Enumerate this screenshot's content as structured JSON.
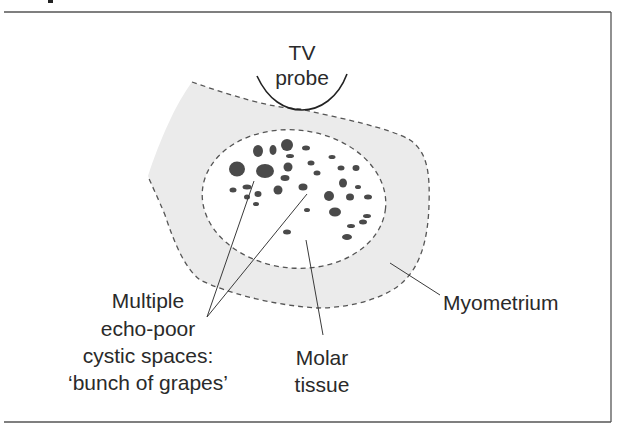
{
  "figure": {
    "title_fragment": "",
    "labels": {
      "probe_line1": "TV",
      "probe_line2": "probe",
      "cysts_line1": "Multiple",
      "cysts_line2": "echo-poor",
      "cysts_line3": "cystic spaces:",
      "cysts_line4": "‘bunch of grapes’",
      "molar_line1": "Molar",
      "molar_line2": "tissue",
      "myometrium": "Myometrium"
    },
    "colors": {
      "myometrium_fill": "#ebebeb",
      "cyst_fill": "#4a4a4a",
      "outline": "#555555",
      "text": "#2a2a2a"
    },
    "cysts": [
      {
        "cx": 258,
        "cy": 151,
        "rx": 5,
        "ry": 6
      },
      {
        "cx": 273,
        "cy": 150,
        "rx": 3.5,
        "ry": 5
      },
      {
        "cx": 287,
        "cy": 145,
        "rx": 6,
        "ry": 6
      },
      {
        "cx": 306,
        "cy": 148,
        "rx": 4,
        "ry": 2.5
      },
      {
        "cx": 290,
        "cy": 156,
        "rx": 4,
        "ry": 2
      },
      {
        "cx": 332,
        "cy": 157,
        "rx": 3.5,
        "ry": 2
      },
      {
        "cx": 237,
        "cy": 169,
        "rx": 8,
        "ry": 7.5
      },
      {
        "cx": 265,
        "cy": 171,
        "rx": 9,
        "ry": 7
      },
      {
        "cx": 288,
        "cy": 167,
        "rx": 4.5,
        "ry": 4.5
      },
      {
        "cx": 311,
        "cy": 163,
        "rx": 3.5,
        "ry": 2.5
      },
      {
        "cx": 341,
        "cy": 168,
        "rx": 3.5,
        "ry": 2.5
      },
      {
        "cx": 356,
        "cy": 168,
        "rx": 3.5,
        "ry": 3
      },
      {
        "cx": 317,
        "cy": 173,
        "rx": 3.5,
        "ry": 2.5
      },
      {
        "cx": 285,
        "cy": 178,
        "rx": 4.5,
        "ry": 3
      },
      {
        "cx": 343,
        "cy": 183,
        "rx": 4,
        "ry": 4.5
      },
      {
        "cx": 358,
        "cy": 187,
        "rx": 3,
        "ry": 2
      },
      {
        "cx": 233,
        "cy": 190,
        "rx": 3.5,
        "ry": 2.5
      },
      {
        "cx": 247,
        "cy": 187,
        "rx": 4.5,
        "ry": 2.5
      },
      {
        "cx": 258,
        "cy": 194,
        "rx": 3.5,
        "ry": 3
      },
      {
        "cx": 247,
        "cy": 197,
        "rx": 3,
        "ry": 2.5
      },
      {
        "cx": 256,
        "cy": 204,
        "rx": 3,
        "ry": 2
      },
      {
        "cx": 278,
        "cy": 190,
        "rx": 4.5,
        "ry": 4.5
      },
      {
        "cx": 303,
        "cy": 187,
        "rx": 4.5,
        "ry": 3.5
      },
      {
        "cx": 329,
        "cy": 196,
        "rx": 5,
        "ry": 5
      },
      {
        "cx": 350,
        "cy": 197,
        "rx": 4,
        "ry": 3.5
      },
      {
        "cx": 368,
        "cy": 197,
        "rx": 4,
        "ry": 2.5
      },
      {
        "cx": 307,
        "cy": 210,
        "rx": 3,
        "ry": 2
      },
      {
        "cx": 335,
        "cy": 212,
        "rx": 6,
        "ry": 4.5
      },
      {
        "cx": 367,
        "cy": 216,
        "rx": 4,
        "ry": 2
      },
      {
        "cx": 363,
        "cy": 222,
        "rx": 4,
        "ry": 2.5
      },
      {
        "cx": 351,
        "cy": 226,
        "rx": 4,
        "ry": 2
      },
      {
        "cx": 287,
        "cy": 232,
        "rx": 4,
        "ry": 2.5
      },
      {
        "cx": 347,
        "cy": 237,
        "rx": 5,
        "ry": 3
      }
    ]
  }
}
